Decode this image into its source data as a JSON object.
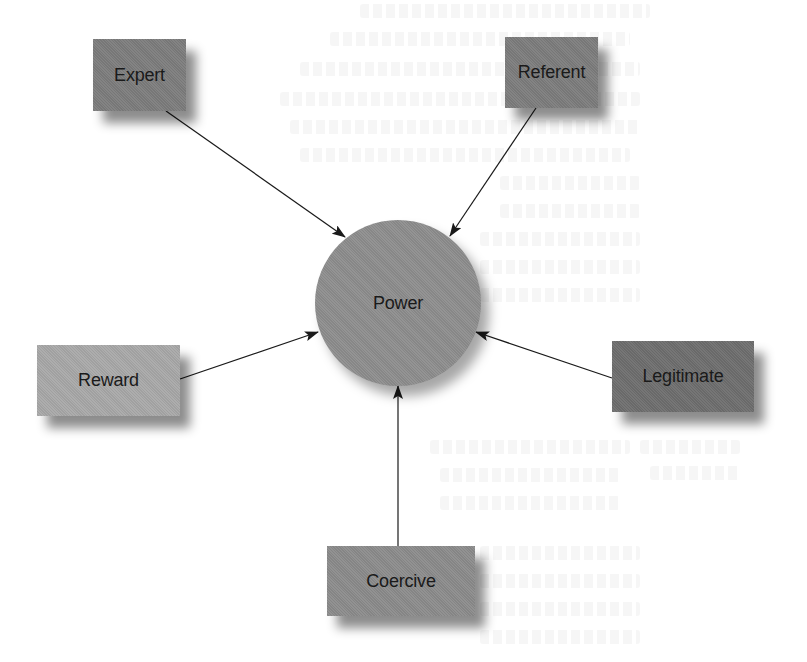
{
  "diagram": {
    "type": "hub-and-spoke",
    "center": {
      "id": "power",
      "label": "Power",
      "shape": "circle",
      "color": "#8e8e8e"
    },
    "nodes": [
      {
        "id": "expert",
        "label": "Expert",
        "shape": "rectangle",
        "color": "#7d7d7d",
        "position": "top-left"
      },
      {
        "id": "referent",
        "label": "Referent",
        "shape": "rectangle",
        "color": "#7d7d7d",
        "position": "top-right"
      },
      {
        "id": "reward",
        "label": "Reward",
        "shape": "rectangle",
        "color": "#a9a9a9",
        "position": "left"
      },
      {
        "id": "legitimate",
        "label": "Legitimate",
        "shape": "rectangle",
        "color": "#6f6f6f",
        "position": "right"
      },
      {
        "id": "coercive",
        "label": "Coercive",
        "shape": "rectangle",
        "color": "#8c8c8c",
        "position": "bottom"
      }
    ],
    "edges": [
      {
        "from": "expert",
        "to": "power",
        "arrow": "end"
      },
      {
        "from": "referent",
        "to": "power",
        "arrow": "end"
      },
      {
        "from": "reward",
        "to": "power",
        "arrow": "end"
      },
      {
        "from": "legitimate",
        "to": "power",
        "arrow": "end"
      },
      {
        "from": "coercive",
        "to": "power",
        "arrow": "end"
      }
    ]
  },
  "colors": {
    "background": "#ffffff",
    "edge": "#1a1a1a",
    "label": "#1a1a1a"
  }
}
